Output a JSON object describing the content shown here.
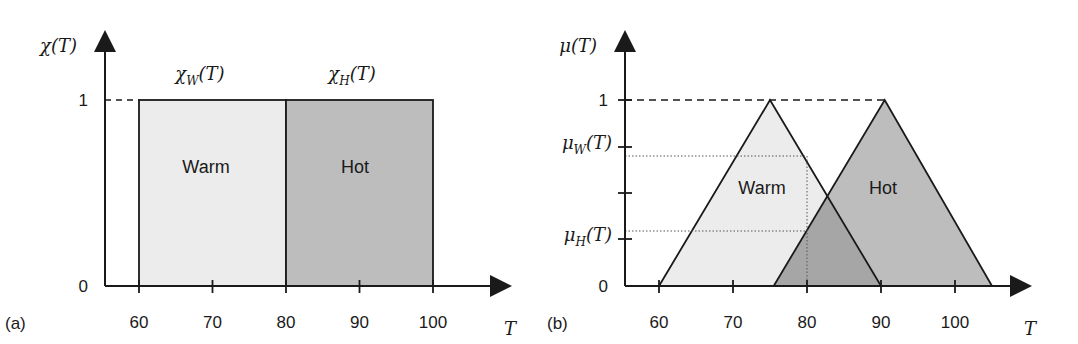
{
  "panels": [
    {
      "id": "a",
      "panel_label": "(a)",
      "y_axis_label": "χ(T)",
      "y_axis_symbol": "χ",
      "x_axis_label": "T",
      "y_ticks": [
        {
          "value": 0,
          "label": "0"
        },
        {
          "value": 1,
          "label": "1"
        }
      ],
      "x_ticks": [
        {
          "value": 60,
          "label": "60"
        },
        {
          "value": 70,
          "label": "70"
        },
        {
          "value": 80,
          "label": "80"
        },
        {
          "value": 90,
          "label": "90"
        },
        {
          "value": 100,
          "label": "100"
        }
      ],
      "sets": [
        {
          "name": "Warm",
          "function_label_symbol": "χ",
          "function_label_sub": "W",
          "function_label_arg": "(T)",
          "shape": "rectangle",
          "x_start": 60,
          "x_end": 80,
          "height": 1,
          "fill": "#ececec"
        },
        {
          "name": "Hot",
          "function_label_symbol": "χ",
          "function_label_sub": "H",
          "function_label_arg": "(T)",
          "shape": "rectangle",
          "x_start": 80,
          "x_end": 100,
          "height": 1,
          "fill": "#bdbdbd"
        }
      ]
    },
    {
      "id": "b",
      "panel_label": "(b)",
      "y_axis_label": "μ(T)",
      "y_axis_symbol": "μ",
      "x_axis_label": "T",
      "y_ticks": [
        {
          "value": 0,
          "label": "0"
        },
        {
          "value": 0.25,
          "label": "μ_H(T)",
          "symbol": "μ",
          "sub": "H",
          "arg": "(T)"
        },
        {
          "value": 0.5,
          "label": ""
        },
        {
          "value": 0.75,
          "label": "μ_W(T)",
          "symbol": "μ",
          "sub": "W",
          "arg": "(T)"
        },
        {
          "value": 1,
          "label": "1"
        }
      ],
      "x_ticks": [
        {
          "value": 60,
          "label": "60"
        },
        {
          "value": 70,
          "label": "70"
        },
        {
          "value": 80,
          "label": "80"
        },
        {
          "value": 90,
          "label": "90"
        },
        {
          "value": 100,
          "label": "100"
        }
      ],
      "sets": [
        {
          "name": "Warm",
          "shape": "triangle",
          "x_start": 60,
          "x_peak": 75,
          "x_end": 90,
          "fill": "#ececec"
        },
        {
          "name": "Hot",
          "shape": "triangle",
          "x_start": 75.5,
          "x_peak": 90.5,
          "x_end": 105,
          "fill": "#bdbdbd"
        }
      ],
      "overlap_fill": "#a6a6a6",
      "reading": {
        "T": 80,
        "mu_W": 0.67,
        "mu_H": 0.3
      }
    }
  ],
  "colors": {
    "axis": "#1a1a1a",
    "dotted": "#555555"
  }
}
